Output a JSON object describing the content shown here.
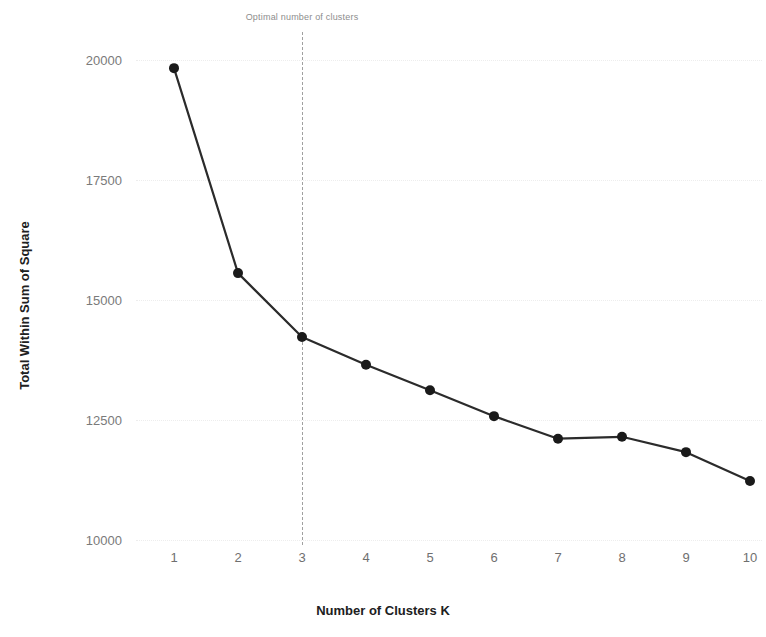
{
  "chart_data": {
    "type": "line",
    "title": "",
    "subtitle": "",
    "xlabel": "Number of Clusters K",
    "ylabel": "Total Within Sum of Square",
    "x": [
      1,
      2,
      3,
      4,
      5,
      6,
      7,
      8,
      9,
      10
    ],
    "categories": [
      "1",
      "2",
      "3",
      "4",
      "5",
      "6",
      "7",
      "8",
      "9",
      "10"
    ],
    "values": [
      19830,
      15560,
      14230,
      13650,
      13120,
      12580,
      12110,
      12150,
      11830,
      11230
    ],
    "series": [
      {
        "name": "Total Within Sum of Square",
        "values": [
          19830,
          15560,
          14230,
          13650,
          13120,
          12580,
          12110,
          12150,
          11830,
          11230
        ]
      }
    ],
    "xlim": [
      0.6,
      10.4
    ],
    "ylim": [
      9750,
      20400
    ],
    "xticks": [
      "1",
      "2",
      "3",
      "4",
      "5",
      "6",
      "7",
      "8",
      "9",
      "10"
    ],
    "yticks": [
      "20000",
      "17500",
      "15000",
      "12500",
      "10000"
    ],
    "ytick_values": [
      20000,
      17500,
      15000,
      12500,
      10000
    ],
    "grid": true,
    "legend": "none",
    "annotations": [
      {
        "text": "Optimal number of clusters",
        "x": 3,
        "type": "vertical-dashed-line-label"
      }
    ],
    "colors": {
      "line": "#2b2b2b",
      "marker": "#1a1a1a",
      "gridline": "#ededed",
      "vline": "#a0a0a0",
      "background": "#ffffff",
      "tick_label": "#7a7a7a",
      "axis_title": "#202020",
      "annotation_text": "#8d8d8d"
    },
    "line_width": 2.2,
    "marker_size": 5
  }
}
